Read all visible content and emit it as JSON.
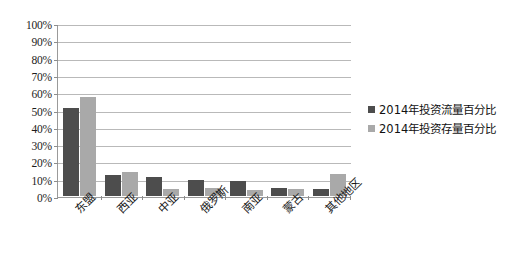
{
  "chart_data": {
    "type": "bar",
    "title": "",
    "xlabel": "",
    "ylabel": "",
    "categories": [
      "东盟",
      "西亚",
      "中亚",
      "俄罗斯",
      "南亚",
      "蒙古",
      "其他地区"
    ],
    "series": [
      {
        "name": "2014年投资流量百分比",
        "color": "#4d4d4d",
        "values": [
          51,
          12,
          11,
          9.5,
          8.5,
          4.5,
          4
        ]
      },
      {
        "name": "2014年投资存量百分比",
        "color": "#a9a9a9",
        "values": [
          57,
          14,
          4,
          4.5,
          3.5,
          4,
          12.5
        ]
      }
    ],
    "ylim": [
      0,
      100
    ],
    "ytick_labels": [
      "0%",
      "10%",
      "20%",
      "30%",
      "40%",
      "50%",
      "60%",
      "70%",
      "80%",
      "90%",
      "100%"
    ],
    "ytick_values": [
      0,
      10,
      20,
      30,
      40,
      50,
      60,
      70,
      80,
      90,
      100
    ],
    "grid": true,
    "legend_position": "right"
  },
  "legend": {
    "items": [
      {
        "label": "2014年投资流量百分比",
        "color": "#4d4d4d"
      },
      {
        "label": "2014年投资存量百分比",
        "color": "#a9a9a9"
      }
    ]
  }
}
